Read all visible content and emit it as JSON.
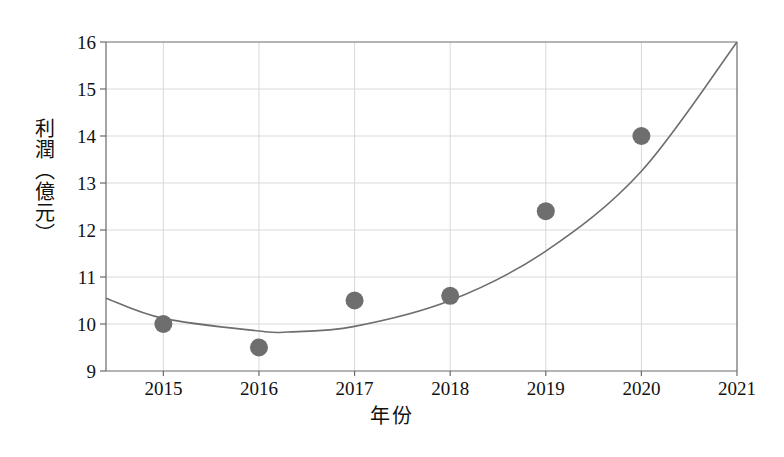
{
  "chart_data": {
    "type": "scatter",
    "title": "",
    "xlabel": "年份",
    "ylabel": "利潤（億元）",
    "categories": [
      2015,
      2016,
      2017,
      2018,
      2019,
      2020
    ],
    "values": [
      10.0,
      9.5,
      10.5,
      10.6,
      12.4,
      14.0
    ],
    "series": [
      {
        "name": "利潤",
        "x": [
          2015,
          2016,
          2017,
          2018,
          2019,
          2020
        ],
        "values": [
          10.0,
          9.5,
          10.5,
          10.6,
          12.4,
          14.0
        ],
        "marker": "filled-circle",
        "color": "#6e6e6e"
      },
      {
        "name": "趨勢曲線",
        "type": "line",
        "x": [
          2014.4,
          2015.0,
          2016.0,
          2016.3,
          2017.0,
          2018.0,
          2019.0,
          2020.0,
          2021.0
        ],
        "values": [
          10.55,
          10.12,
          9.85,
          9.83,
          9.95,
          10.5,
          11.55,
          13.25,
          16.0
        ],
        "color": "#6e6e6e"
      }
    ],
    "xlim": [
      2014.4,
      2021.0
    ],
    "ylim": [
      9,
      16
    ],
    "xticks": [
      2015,
      2016,
      2017,
      2018,
      2019,
      2020,
      2021
    ],
    "yticks": [
      9,
      10,
      11,
      12,
      13,
      14,
      15,
      16
    ],
    "xtick_labels": [
      "2015",
      "2016",
      "2017",
      "2018",
      "2019",
      "2020",
      "2021"
    ],
    "ytick_labels": [
      "9",
      "10",
      "11",
      "12",
      "13",
      "14",
      "15",
      "16"
    ],
    "grid": true,
    "legend": "none",
    "colors": {
      "marker": "#6e6e6e",
      "curve": "#6e6e6e",
      "grid": "#d9d9d9",
      "axis": "#6a6a6a",
      "text": "#111111",
      "background": "#ffffff"
    }
  },
  "axes": {
    "y_title": "利潤（億元）",
    "x_title": "年份",
    "y_ticks": [
      {
        "label": "16",
        "value": 16
      },
      {
        "label": "15",
        "value": 15
      },
      {
        "label": "14",
        "value": 14
      },
      {
        "label": "13",
        "value": 13
      },
      {
        "label": "12",
        "value": 12
      },
      {
        "label": "11",
        "value": 11
      },
      {
        "label": "10",
        "value": 10
      },
      {
        "label": "9",
        "value": 9
      }
    ],
    "x_ticks": [
      {
        "label": "2015",
        "value": 2015
      },
      {
        "label": "2016",
        "value": 2016
      },
      {
        "label": "2017",
        "value": 2017
      },
      {
        "label": "2018",
        "value": 2018
      },
      {
        "label": "2019",
        "value": 2019
      },
      {
        "label": "2020",
        "value": 2020
      },
      {
        "label": "2021",
        "value": 2021
      }
    ]
  }
}
